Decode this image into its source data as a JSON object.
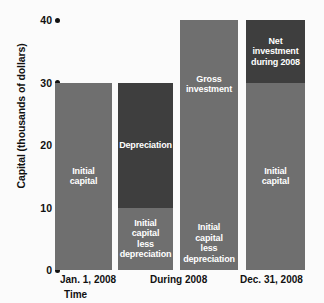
{
  "chart_data": {
    "type": "bar",
    "title": "",
    "subtitle": "",
    "xlabel": "Time",
    "ylabel": "Capital (thousands of dollars)",
    "ylim": [
      0,
      40
    ],
    "yticks": [
      0,
      10,
      20,
      30,
      40
    ],
    "ytick_labels": [
      "0",
      "10",
      "20",
      "30",
      "40"
    ],
    "grid": false,
    "legend": "none",
    "categories": [
      "Jan. 1, 2008",
      "During 2008",
      "Dec. 31, 2008"
    ],
    "category_labels": [
      {
        "text": "Jan. 1, 2008"
      },
      {
        "text": "During 2008"
      },
      {
        "text": "Dec. 31, 2008"
      }
    ],
    "bars": [
      {
        "name": "jan-1-2008",
        "category": "Jan. 1, 2008",
        "total": 30,
        "segments": [
          {
            "label": "Initial\ncapital",
            "from": 0,
            "to": 30,
            "value": 30,
            "color": "#6f6f6f",
            "shade": "light",
            "position": "middle"
          }
        ]
      },
      {
        "name": "during-2008-depreciation",
        "category": "During 2008",
        "total": 30,
        "segments": [
          {
            "label": "Depreciation",
            "from": 10,
            "to": 30,
            "value": 20,
            "color": "#3e3e3e",
            "shade": "dark",
            "position": "middle"
          },
          {
            "label": "Initial\ncapital\nless\ndepreciation",
            "from": 0,
            "to": 10,
            "value": 10,
            "color": "#6f6f6f",
            "shade": "light",
            "position": "middle"
          }
        ]
      },
      {
        "name": "during-2008-gross-investment",
        "category": "During 2008",
        "total": 40,
        "segments": [
          {
            "label": "Gross\ninvestment",
            "from": 10,
            "to": 40,
            "value": 30,
            "color": "#6f6f6f",
            "shade": "light",
            "position": "upper"
          },
          {
            "label": "Initial\ncapital\nless\ndepreciation",
            "from": 0,
            "to": 10,
            "value": 10,
            "color": "#6f6f6f",
            "shade": "light",
            "position": "lower"
          }
        ]
      },
      {
        "name": "dec-31-2008",
        "category": "Dec. 31, 2008",
        "total": 40,
        "segments": [
          {
            "label": "Net\ninvestment\nduring 2008",
            "from": 30,
            "to": 40,
            "value": 10,
            "color": "#3e3e3e",
            "shade": "dark",
            "position": "middle"
          },
          {
            "label": "Initial\ncapital",
            "from": 0,
            "to": 30,
            "value": 30,
            "color": "#6f6f6f",
            "shade": "light",
            "position": "middle"
          }
        ]
      }
    ],
    "colors": {
      "light_gray": "#6f6f6f",
      "dark_gray": "#3e3e3e",
      "background": "#fbfbfb",
      "text": "#111111",
      "bar_text": "#ffffff"
    }
  }
}
